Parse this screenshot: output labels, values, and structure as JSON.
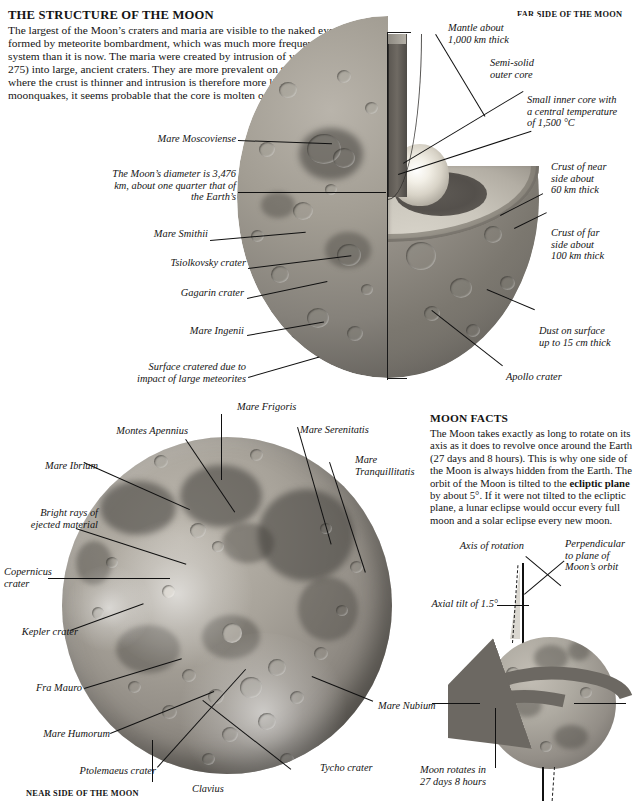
{
  "article": {
    "heading": "THE STRUCTURE OF THE MOON",
    "intro": "The largest of the Moon’s craters and maria are visible to the naked eye. The craters were formed by meteorite bombardment, which was much more frequent in the early solar system than it is now. The maria were created by intrusion of volcanic lava (see pp. 274-275) into large, ancient craters. They are more prevalent on the near side of the Moon, where the crust is thinner and intrusion is therefore more likely. From ",
    "intro_bold": "seismic analysis",
    "intro_tail": " of moonquakes, it seems probable that the core is molten or at least semi-molten."
  },
  "captions": {
    "far_side": "FAR SIDE OF THE MOON",
    "near_side": "NEAR SIDE OF THE MOON"
  },
  "cutaway_labels": {
    "mantle": "Mantle about\n1,000 km thick",
    "outer_core": "Semi-solid\nouter core",
    "inner_core": "Small inner core with\na central temperature\nof 1,500 °C",
    "crust_near": "Crust of near\nside about\n60 km thick",
    "crust_far": "Crust of far\nside about\n100 km thick",
    "dust": "Dust on surface\nup to 15 cm thick",
    "apollo": "Apollo crater",
    "moscoviense": "Mare Moscoviense",
    "diameter": "The Moon’s diameter is 3,476\nkm, about one quarter that of\nthe Earth’s",
    "smithii": "Mare Smithii",
    "tsiolkovsky": "Tsiolkovsky crater",
    "gagarin": "Gagarin crater",
    "ingenii": "Mare Ingenii",
    "surface": "Surface cratered due to\nimpact of large meteorites"
  },
  "nearside_labels": {
    "frigoris": "Mare Frigoris",
    "apennius": "Montes Apennius",
    "serenitatis": "Mare Serenitatis",
    "tranquillitatis": "Mare\nTranquillitatis",
    "ibrium": "Mare Ibrium",
    "rays": "Bright rays of\nejected material",
    "copernicus": "Copernicus\ncrater",
    "kepler": "Kepler crater",
    "framauro": "Fra Mauro",
    "humorum": "Mare Humorum",
    "ptolemaeus": "Ptolemaeus crater",
    "clavius": "Clavius",
    "tycho": "Tycho crater",
    "nubium": "Mare Nubium"
  },
  "moon_facts": {
    "heading": "MOON FACTS",
    "text_1": "The Moon takes exactly as long to rotate on its axis as it does to revolve once around the Earth (27 days and 8 hours). This is why one side of the Moon is always hidden from the Earth. The orbit of the Moon is tilted to the ",
    "bold": "ecliptic plane",
    "text_2": " by about 5°. If it were not tilted to the ecliptic plane, a lunar eclipse would occur every full moon and a solar eclipse every new moon."
  },
  "tilt_labels": {
    "axis": "Axis of rotation",
    "perpendicular": "Perpendicular\nto plane of\nMoon’s orbit",
    "axial_tilt": "Axial tilt of 1.5°",
    "rotation": "Moon rotates in\n27 days 8 hours"
  }
}
